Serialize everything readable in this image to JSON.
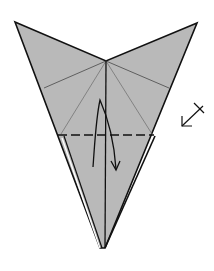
{
  "diagram": {
    "type": "origami-step",
    "colors": {
      "background": "#ffffff",
      "paper_fill": "#b9b9b9",
      "edge": "#111111",
      "crease": "#555555",
      "fold_line": "#111111"
    },
    "shape": {
      "outline": [
        [
          15,
          22
        ],
        [
          106,
          61
        ],
        [
          197,
          23
        ],
        [
          105,
          248
        ],
        [
          100,
          248
        ]
      ],
      "back_layer_edge": [
        [
          61,
          135
        ],
        [
          97,
          247
        ]
      ],
      "center_line": [
        [
          106,
          61
        ],
        [
          106,
          248
        ]
      ]
    },
    "creases": [
      [
        [
          106,
          61
        ],
        [
          44,
          88
        ]
      ],
      [
        [
          106,
          61
        ],
        [
          169,
          88
        ]
      ],
      [
        [
          106,
          61
        ],
        [
          61,
          134
        ]
      ],
      [
        [
          106,
          61
        ],
        [
          152,
          134
        ]
      ]
    ],
    "valley_fold": {
      "from": [
        58,
        135
      ],
      "to": [
        154,
        135
      ],
      "style": "dashed"
    },
    "fold_arrow": {
      "path": "M93,167 C95,140 96,118 100,100 C108,118 114,140 116,169",
      "direction": "down"
    },
    "turn_symbol": {
      "name": "repeat-behind",
      "arrow_from": [
        203,
        105
      ],
      "arrow_to": [
        182,
        126
      ],
      "x_mark_center": [
        199,
        108
      ]
    }
  }
}
